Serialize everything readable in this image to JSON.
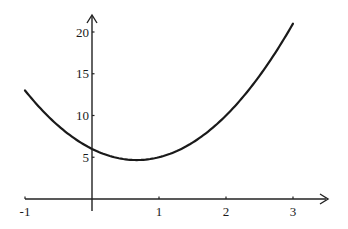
{
  "chart_data": {
    "type": "line",
    "title": "",
    "xlabel": "",
    "ylabel": "",
    "function": "f(x) = 3x^2 - 4x + 6",
    "xlim": [
      -1,
      3
    ],
    "ylim": [
      0,
      21
    ],
    "grid": false,
    "legend": null,
    "x_ticks": [
      -1,
      1,
      2,
      3
    ],
    "x_tick_labels": [
      "-1",
      "1",
      "2",
      "3"
    ],
    "y_ticks": [
      5,
      10,
      15,
      20
    ],
    "y_tick_labels": [
      "5",
      "10",
      "15",
      "20"
    ],
    "series": [
      {
        "name": "curve",
        "x": [
          -1,
          -0.5,
          0,
          0.5,
          0.667,
          1,
          1.5,
          2,
          2.5,
          3
        ],
        "y": [
          13,
          8.75,
          6,
          4.75,
          4.67,
          5,
          6.75,
          10,
          14.75,
          21
        ]
      }
    ],
    "minimum": {
      "x": 0.667,
      "y": 4.67
    },
    "y_intercept": 6
  },
  "colors": {
    "line": "#1a1a1a",
    "axis": "#222222",
    "background": "#ffffff"
  }
}
